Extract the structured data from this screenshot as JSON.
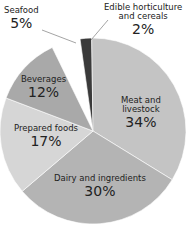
{
  "chart_data": {
    "type": "pie",
    "title": "",
    "slices": [
      {
        "label": "Edible horticulture and cereals",
        "value": 2,
        "display": "2%",
        "color": "#3a3a3a"
      },
      {
        "label": "Meat and livestock",
        "value": 34,
        "display": "34%",
        "color": "#c4c4c4"
      },
      {
        "label": "Dairy and ingredients",
        "value": 30,
        "display": "30%",
        "color": "#b4b4b4"
      },
      {
        "label": "Prepared foods",
        "value": 17,
        "display": "17%",
        "color": "#d6d6d6"
      },
      {
        "label": "Beverages",
        "value": 12,
        "display": "12%",
        "color": "#a9a9a9"
      },
      {
        "label": "Seafood",
        "value": 5,
        "display": "5%",
        "color": "#ffffff",
        "exploded": true
      }
    ],
    "start_angle_deg": -8,
    "legend": "none (inline labels)"
  },
  "labels": {
    "edible": {
      "line1": "Edible horticulture",
      "line2": "and cereals",
      "pct": "2%"
    },
    "meat": {
      "line1": "Meat and",
      "line2": "livestock",
      "pct": "34%"
    },
    "dairy": {
      "line1": "Dairy and ingredients",
      "pct": "30%"
    },
    "prepared": {
      "line1": "Prepared foods",
      "pct": "17%"
    },
    "beverages": {
      "line1": "Beverages",
      "pct": "12%"
    },
    "seafood": {
      "line1": "Seafood",
      "pct": "5%"
    }
  }
}
